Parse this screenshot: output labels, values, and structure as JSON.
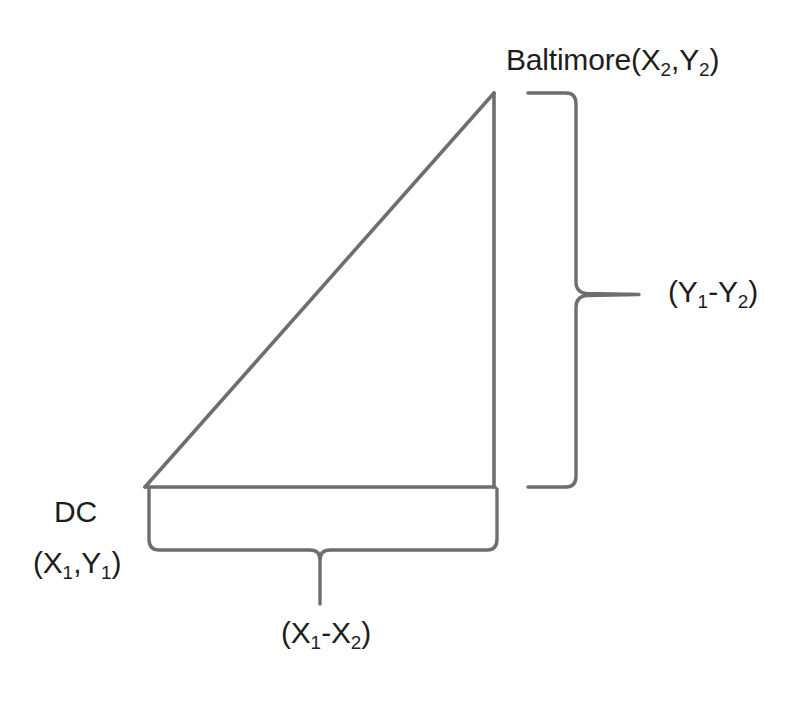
{
  "figure": {
    "title_text": "",
    "background_color": "#ffffff",
    "stroke_color": "#6e6e6e",
    "text_color": "#1d1d1d",
    "labels": {
      "baltimore_vertex": "Baltimore (X2,Y2)",
      "baltimore_name": "Baltimore",
      "baltimore_coords_open": "(X",
      "baltimore_sub_1": "2",
      "baltimore_comma": ",Y",
      "baltimore_sub_2": "2",
      "baltimore_close": ")",
      "dc_name": "DC",
      "dc_coords": "(X1,Y1)",
      "dc_open": "(X",
      "dc_sub_1": "1",
      "dc_comma": ",Y",
      "dc_sub_2": "1",
      "dc_close": ")",
      "vertical_difference": "(Y1-Y2)",
      "vd_open": "(Y",
      "vd_sub_1": "1",
      "vd_minus": "-Y",
      "vd_sub_2": "2",
      "vd_close": ")",
      "horizontal_difference": "(X1-X2)",
      "hd_open": "(X",
      "hd_sub_1": "1",
      "hd_minus": "-X",
      "hd_sub_2": "2",
      "hd_close": ")"
    },
    "geometry": {
      "triangle": {
        "vertex_dc": [
          145,
          487
        ],
        "vertex_baltimore": [
          494,
          93
        ],
        "vertex_right_angle": [
          494,
          487
        ],
        "hypotenuse_description": "line from DC to Baltimore",
        "vertical_leg_description": "line from Baltimore down to right angle",
        "horizontal_leg_description": "line from DC to right angle"
      },
      "right_brace": {
        "top": 93,
        "bottom": 487,
        "spine_x": 576,
        "arm_start_x": 528,
        "tip_x": 639,
        "tip_y": 294
      },
      "bottom_brace": {
        "left": 149,
        "right": 497,
        "spine_y": 550,
        "arm_start_y": 489,
        "tip_x": 320,
        "tip_y": 604
      }
    }
  }
}
